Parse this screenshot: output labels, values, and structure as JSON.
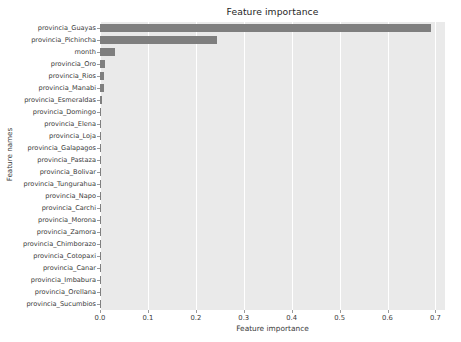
{
  "chart_data": {
    "type": "bar",
    "orientation": "horizontal",
    "title": "Feature importance",
    "xlabel": "Feature importance",
    "ylabel": "Feature names",
    "xlim": [
      0.0,
      0.72
    ],
    "ylim": [
      0,
      24
    ],
    "grid": "vertical-only",
    "legend": null,
    "bar_color": "#7f7f7f",
    "plot_background": "#eaeaea",
    "figure_background": "#ffffff",
    "xticks": [
      "0.0",
      "0.1",
      "0.2",
      "0.3",
      "0.4",
      "0.5",
      "0.6",
      "0.7"
    ],
    "xtick_values": [
      0.0,
      0.1,
      0.2,
      0.3,
      0.4,
      0.5,
      0.6,
      0.7
    ],
    "categories": [
      "provincia_Guayas",
      "provincia_Pichincha",
      "month",
      "provincia_Oro",
      "provincia_Rios",
      "provincia_Manabi",
      "provincia_Esmeraldas",
      "provincia_Domingo",
      "provincia_Elena",
      "provincia_Loja",
      "provincia_Galapagos",
      "provincia_Pastaza",
      "provincia_Bolivar",
      "provincia_Tungurahua",
      "provincia_Napo",
      "provincia_Carchi",
      "provincia_Morona",
      "provincia_Zamora",
      "provincia_Chimborazo",
      "provincia_Cotopaxi",
      "provincia_Canar",
      "provincia_Imbabura",
      "provincia_Orellana",
      "provincia_Sucumbios"
    ],
    "values": [
      0.69,
      0.245,
      0.032,
      0.01,
      0.009,
      0.008,
      0.004,
      0.003,
      0.002,
      0.0015,
      0.0012,
      0.001,
      0.0009,
      0.0008,
      0.0007,
      0.0006,
      0.0005,
      0.0004,
      0.0004,
      0.0003,
      0.0003,
      0.0002,
      0.0002,
      0.0001
    ]
  }
}
